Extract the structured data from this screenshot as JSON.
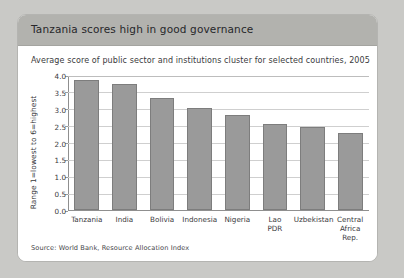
{
  "card": {
    "title": "Tanzania scores high in good governance",
    "subtitle": "Average score of public sector and institutions cluster for selected countries, 2005",
    "source": "Source: World Bank, Resource Allocation Index"
  },
  "colors": {
    "page_background": "#c9c9c6",
    "card_background": "#ffffff",
    "header_band": "#b2b2ae",
    "bar_fill": "#9a9a9a",
    "bar_stroke": "#7d7d7d",
    "gridline": "#cfcfcf",
    "axis_line": "#8f8f8f",
    "text": "#3a3a3d"
  },
  "chart_data": {
    "type": "bar",
    "title": "Tanzania scores high in good governance",
    "subtitle": "Average score of public sector and institutions cluster for selected countries, 2005",
    "categories": [
      "Tanzania",
      "India",
      "Bolivia",
      "Indonesia",
      "Nigeria",
      "Lao\nPDR",
      "Uzbekistan",
      "Central\nAfrica\nRep."
    ],
    "values": [
      3.85,
      3.72,
      3.33,
      3.03,
      2.82,
      2.55,
      2.45,
      2.27
    ],
    "xlabel": "",
    "ylabel": "Range 1=lowest to 6=highest",
    "ylim": [
      0.0,
      4.0
    ],
    "ytick_labels": [
      "0.0",
      "0.5",
      "1.0",
      "1.5",
      "2.0",
      "2.5",
      "3.0",
      "3.5",
      "4.0"
    ],
    "ytick_values": [
      0.0,
      0.5,
      1.0,
      1.5,
      2.0,
      2.5,
      3.0,
      3.5,
      4.0
    ],
    "grid": true,
    "legend": false,
    "source": "Source: World Bank, Resource Allocation Index"
  }
}
